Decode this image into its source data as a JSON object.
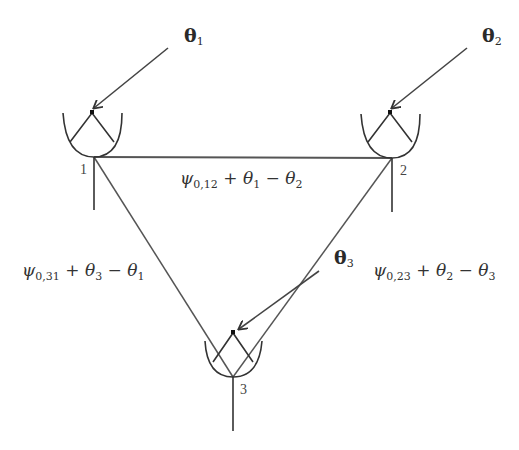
{
  "diagram": {
    "type": "three-node antenna phase diagram",
    "colors": {
      "line": "#444444",
      "background": "#ffffff",
      "text": "#2a2a2a"
    },
    "nodes": [
      {
        "id": "1",
        "label": "1",
        "incident_angle": {
          "symbol": "θ",
          "sub": "1"
        }
      },
      {
        "id": "2",
        "label": "2",
        "incident_angle": {
          "symbol": "θ",
          "sub": "2"
        }
      },
      {
        "id": "3",
        "label": "3",
        "incident_angle": {
          "symbol": "θ",
          "sub": "3"
        }
      }
    ],
    "edges": [
      {
        "from": "1",
        "to": "2",
        "label": {
          "psi": "ψ",
          "psi_sub": "0,12",
          "rest": " + θ",
          "a_sub": "1",
          "minus": " − θ",
          "b_sub": "2"
        }
      },
      {
        "from": "3",
        "to": "1",
        "label": {
          "psi": "ψ",
          "psi_sub": "0,31",
          "rest": " + θ",
          "a_sub": "3",
          "minus": " − θ",
          "b_sub": "1"
        }
      },
      {
        "from": "2",
        "to": "3",
        "label": {
          "psi": "ψ",
          "psi_sub": "0,23",
          "rest": " + θ",
          "a_sub": "2",
          "minus": " − θ",
          "b_sub": "3"
        }
      }
    ]
  }
}
